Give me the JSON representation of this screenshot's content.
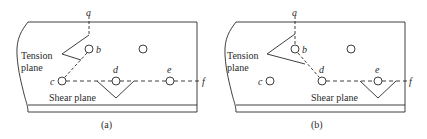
{
  "figure": {
    "panels": [
      {
        "caption": "(a)",
        "points": {
          "a": "a",
          "b": "b",
          "c": "c",
          "d": "d",
          "e": "e",
          "f": "f"
        },
        "tension_label_line1": "Tension",
        "tension_label_line2": "plane",
        "shear_label": "Shear plane"
      },
      {
        "caption": "(b)",
        "points": {
          "a": "a",
          "b": "b",
          "c": "c",
          "d": "d",
          "e": "e",
          "f": "f"
        },
        "tension_label_line1": "Tension",
        "tension_label_line2": "plane",
        "shear_label": "Shear plane"
      }
    ],
    "colors": {
      "ink": "#2a2a2a",
      "background": "#ffffff"
    }
  }
}
